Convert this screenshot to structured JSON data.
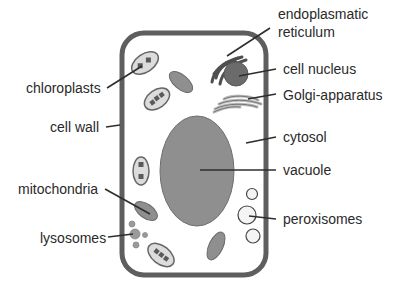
{
  "colors": {
    "wall": "#5e5e5e",
    "organelle_fill": "#8f8f8f",
    "organelle_stroke": "#6a6a6a",
    "light_fill": "#e6e6e6",
    "dark_fill": "#6b6b6b",
    "pointer": "#2e2e2e",
    "text": "#2a2a2a"
  },
  "labels": {
    "endoplasmatic_reticulum_line1": "endoplasmatic",
    "endoplasmatic_reticulum_line2": "reticulum",
    "cell_nucleus": "cell nucleus",
    "golgi_apparatus": "Golgi-apparatus",
    "cytosol": "cytosol",
    "vacuole": "vacuole",
    "peroxisomes": "peroxisomes",
    "chloroplasts": "chloroplasts",
    "cell_wall": "cell wall",
    "mitochondria": "mitochondria",
    "lysosomes": "lysosomes"
  }
}
